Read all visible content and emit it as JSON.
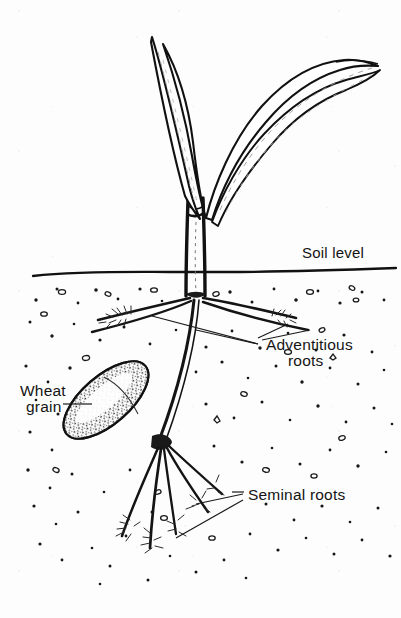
{
  "figure": {
    "title": "Wheat seedling root structure diagram",
    "style": "black-and-white line drawing with stippled soil",
    "background_color": "#fdfdfd",
    "ink_color": "#141414"
  },
  "labels": {
    "soil_level": "Soil level",
    "adventitious_line1": "Adventitious",
    "adventitious_line2": "roots",
    "wheat_line1": "Wheat",
    "wheat_line2": "grain",
    "seminal": "Seminal roots"
  },
  "parts": {
    "leaf_left": "leaf-upright-left",
    "leaf_right": "leaf-arching-right",
    "stem": "stem-coleoptile",
    "soil_line": "soil-surface-line",
    "crown_node": "adventitious-crown-node",
    "seed_node": "seminal-root-node",
    "grain": "wheat-grain-ellipse"
  },
  "counts": {
    "leaves": 2,
    "adventitious_roots": 4,
    "seminal_roots": 5
  },
  "geometry": {
    "soil_level_y": 272,
    "stem_x": 196,
    "crown_node_y": 296,
    "seed_node_y": 442,
    "canvas_width": 401,
    "canvas_height": 618
  }
}
